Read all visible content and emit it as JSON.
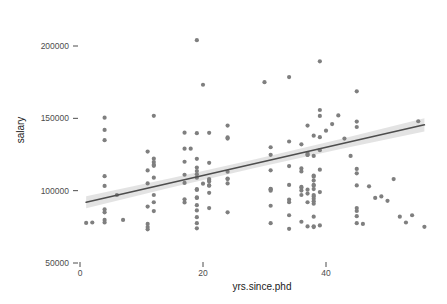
{
  "chart_data": {
    "type": "scatter",
    "title": "",
    "xlabel": "yrs.since.phd",
    "ylabel": "salary",
    "xlim": [
      -2,
      58
    ],
    "ylim": [
      45000,
      235000
    ],
    "xticks": [
      0,
      20,
      40
    ],
    "xticklabels": [
      "0",
      "20",
      "40"
    ],
    "yticks": [
      50000,
      100000,
      150000,
      200000
    ],
    "yticklabels": [
      "50000",
      "100000",
      "150000",
      "200000"
    ],
    "grid": false,
    "legend": "none",
    "point_color": "#7f7f7f",
    "line_color": "#4d4d4d",
    "band_color": "#d9d9d9",
    "background": "#ffffff",
    "regression": {
      "type": "linear-fit-with-confidence-band",
      "x_start": 1,
      "x_end": 56,
      "y_start": 92000,
      "y_end": 145500,
      "band_halfwidth_start": 4200,
      "band_halfwidth_mid": 1600,
      "band_halfwidth_end": 4600
    },
    "points": [
      [
        19,
        139750
      ],
      [
        20,
        173200
      ],
      [
        4,
        79750
      ],
      [
        45,
        115000
      ],
      [
        40,
        141500
      ],
      [
        6,
        97000
      ],
      [
        30,
        175000
      ],
      [
        45,
        147765
      ],
      [
        21,
        119250
      ],
      [
        18,
        129000
      ],
      [
        12,
        119800
      ],
      [
        7,
        79800
      ],
      [
        1,
        77700
      ],
      [
        2,
        78000
      ],
      [
        20,
        104800
      ],
      [
        12,
        117150
      ],
      [
        19,
        101000
      ],
      [
        38,
        103450
      ],
      [
        37,
        124750
      ],
      [
        39,
        137000
      ],
      [
        31,
        89565
      ],
      [
        36,
        102580
      ],
      [
        34,
        93904
      ],
      [
        24,
        113068
      ],
      [
        38,
        74830
      ],
      [
        21,
        106294
      ],
      [
        4,
        134885
      ],
      [
        45,
        82379
      ],
      [
        11,
        77000
      ],
      [
        19,
        86373
      ],
      [
        12,
        151768
      ],
      [
        17,
        140096
      ],
      [
        19,
        74000
      ],
      [
        38,
        104054
      ],
      [
        37,
        124714
      ],
      [
        39,
        151650
      ],
      [
        31,
        101210
      ],
      [
        36,
        115341
      ],
      [
        34,
        117021
      ],
      [
        24,
        108423
      ],
      [
        38,
        101133
      ],
      [
        21,
        103613
      ],
      [
        4,
        150480
      ],
      [
        45,
        88000
      ],
      [
        11,
        73300
      ],
      [
        19,
        109000
      ],
      [
        12,
        109000
      ],
      [
        17,
        129000
      ],
      [
        19,
        113600
      ],
      [
        38,
        92700
      ],
      [
        37,
        92000
      ],
      [
        39,
        189409
      ],
      [
        31,
        114028
      ],
      [
        36,
        113300
      ],
      [
        34,
        92050
      ],
      [
        24,
        145000
      ],
      [
        38,
        109650
      ],
      [
        21,
        98524
      ],
      [
        4,
        85000
      ],
      [
        45,
        168635
      ],
      [
        11,
        127000
      ],
      [
        19,
        204000
      ],
      [
        12,
        97000
      ],
      [
        17,
        111000
      ],
      [
        19,
        100500
      ],
      [
        38,
        97000
      ],
      [
        37,
        145000
      ],
      [
        39,
        155750
      ],
      [
        31,
        100000
      ],
      [
        36,
        97000
      ],
      [
        34,
        178500
      ],
      [
        24,
        108000
      ],
      [
        38,
        110415
      ],
      [
        21,
        107309
      ],
      [
        4,
        103275
      ],
      [
        45,
        103649
      ],
      [
        11,
        74856
      ],
      [
        19,
        111350
      ],
      [
        12,
        122100
      ],
      [
        17,
        105350
      ],
      [
        19,
        95350
      ],
      [
        38,
        94350
      ],
      [
        37,
        100700
      ],
      [
        39,
        114500
      ],
      [
        31,
        124750
      ],
      [
        36,
        100075
      ],
      [
        34,
        73600
      ],
      [
        24,
        136800
      ],
      [
        38,
        91000
      ],
      [
        21,
        103467
      ],
      [
        4,
        87000
      ],
      [
        45,
        77500
      ],
      [
        11,
        105000
      ],
      [
        19,
        81700
      ],
      [
        12,
        85900
      ],
      [
        17,
        91900
      ],
      [
        19,
        77500
      ],
      [
        38,
        75350
      ],
      [
        37,
        75280
      ],
      [
        39,
        76000
      ],
      [
        31,
        77500
      ],
      [
        36,
        78500
      ],
      [
        34,
        83000
      ],
      [
        24,
        85000
      ],
      [
        38,
        82000
      ],
      [
        21,
        88000
      ],
      [
        4,
        78000
      ],
      [
        45,
        86000
      ],
      [
        11,
        89000
      ],
      [
        19,
        90000
      ],
      [
        12,
        92000
      ],
      [
        17,
        94000
      ],
      [
        19,
        95000
      ],
      [
        38,
        96000
      ],
      [
        37,
        98000
      ],
      [
        39,
        99000
      ],
      [
        31,
        101000
      ],
      [
        36,
        102000
      ],
      [
        34,
        104000
      ],
      [
        24,
        105000
      ],
      [
        38,
        107000
      ],
      [
        21,
        108000
      ],
      [
        4,
        110000
      ],
      [
        45,
        112000
      ],
      [
        11,
        114000
      ],
      [
        19,
        116000
      ],
      [
        12,
        118000
      ],
      [
        17,
        120000
      ],
      [
        19,
        122000
      ],
      [
        38,
        124000
      ],
      [
        37,
        126000
      ],
      [
        39,
        128000
      ],
      [
        31,
        130000
      ],
      [
        36,
        132000
      ],
      [
        34,
        134000
      ],
      [
        24,
        136000
      ],
      [
        38,
        138000
      ],
      [
        21,
        140000
      ],
      [
        4,
        142000
      ],
      [
        45,
        144000
      ],
      [
        52,
        82000
      ],
      [
        53,
        78000
      ],
      [
        56,
        75000
      ],
      [
        48,
        95000
      ],
      [
        50,
        93000
      ],
      [
        49,
        96000
      ],
      [
        51,
        108000
      ],
      [
        54,
        83000
      ],
      [
        55,
        148000
      ],
      [
        47,
        103000
      ],
      [
        46,
        77000
      ],
      [
        44,
        124000
      ],
      [
        43,
        136000
      ],
      [
        42,
        152000
      ],
      [
        41,
        146000
      ]
    ]
  },
  "axes": {
    "y_title": "salary",
    "x_title": "yrs.since.phd"
  }
}
